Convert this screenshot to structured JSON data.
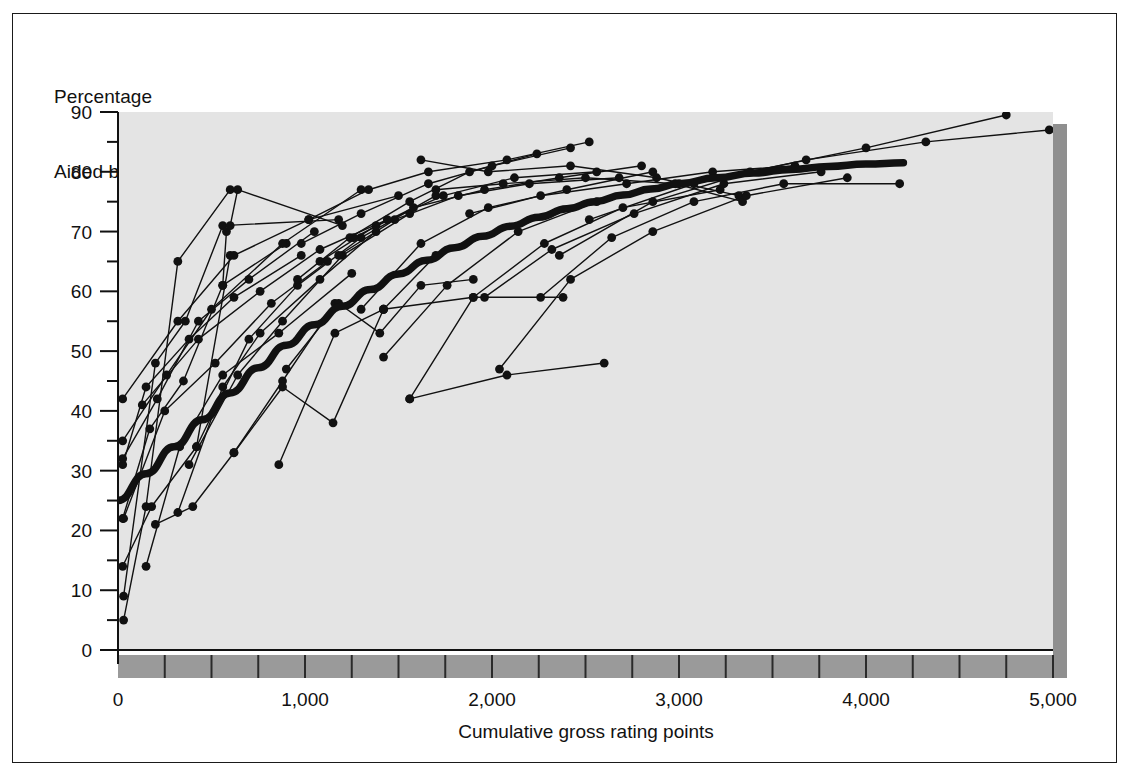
{
  "figure": {
    "title_lines": [
      "Percentage",
      "Aided brand awareness"
    ],
    "x_axis_title": "Cumulative gross rating points",
    "background": "#ffffff",
    "plot_fill": "#e4e4e4",
    "band_fill": "#9a9a9a",
    "shadow_fill": "#8f8f8f",
    "ink": "#111111"
  },
  "chart_data": {
    "type": "line",
    "title": "Aided brand awareness",
    "subtitle": "Percentage",
    "xlabel": "Cumulative gross rating points",
    "ylabel": "Percentage / Aided brand awareness",
    "xlim": [
      0,
      5000
    ],
    "ylim": [
      0,
      90
    ],
    "xticks": [
      0,
      1000,
      2000,
      3000,
      4000,
      5000
    ],
    "xticklabels": [
      "0",
      "1,000",
      "2,000",
      "3,000",
      "4,000",
      "5,000"
    ],
    "yticks": [
      0,
      10,
      20,
      30,
      40,
      50,
      60,
      70,
      80,
      90
    ],
    "yticklabels": [
      "0",
      "10",
      "20",
      "30",
      "40",
      "50",
      "60",
      "70",
      "80",
      "90"
    ],
    "y_minor_ticks": [
      5,
      15,
      25,
      35,
      45,
      55,
      65,
      75,
      85
    ],
    "x_minor_step": 250,
    "grid": false,
    "legend": null,
    "marker": "filled-circle",
    "trend": {
      "name": "Fitted response curve",
      "style": "thick-smooth-line",
      "points": [
        [
          0,
          25.0
        ],
        [
          150,
          29.5
        ],
        [
          300,
          34.0
        ],
        [
          450,
          38.5
        ],
        [
          600,
          43.0
        ],
        [
          750,
          47.2
        ],
        [
          900,
          51.0
        ],
        [
          1050,
          54.4
        ],
        [
          1200,
          57.5
        ],
        [
          1350,
          60.3
        ],
        [
          1500,
          62.9
        ],
        [
          1650,
          65.2
        ],
        [
          1800,
          67.3
        ],
        [
          1950,
          69.2
        ],
        [
          2100,
          70.9
        ],
        [
          2250,
          72.4
        ],
        [
          2400,
          73.8
        ],
        [
          2550,
          75.0
        ],
        [
          2700,
          76.1
        ],
        [
          2850,
          77.1
        ],
        [
          3000,
          78.0
        ],
        [
          3200,
          79.0
        ],
        [
          3400,
          79.8
        ],
        [
          3600,
          80.4
        ],
        [
          3800,
          80.9
        ],
        [
          4000,
          81.3
        ],
        [
          4200,
          81.5
        ]
      ]
    },
    "series": [
      {
        "name": "brand-01",
        "points": [
          [
            30,
            5
          ],
          [
            150,
            24
          ],
          [
            320,
            65
          ],
          [
            600,
            77
          ]
        ]
      },
      {
        "name": "brand-02",
        "points": [
          [
            30,
            9
          ],
          [
            200,
            48
          ],
          [
            360,
            55
          ],
          [
            560,
            71
          ],
          [
            1180,
            72
          ]
        ]
      },
      {
        "name": "brand-03",
        "points": [
          [
            25,
            14
          ],
          [
            180,
            24
          ],
          [
            420,
            34
          ],
          [
            600,
            66
          ]
        ]
      },
      {
        "name": "brand-04",
        "points": [
          [
            25,
            22
          ],
          [
            170,
            37
          ],
          [
            350,
            45
          ],
          [
            560,
            61
          ],
          [
            900,
            68
          ]
        ]
      },
      {
        "name": "brand-05",
        "points": [
          [
            25,
            31
          ],
          [
            150,
            44
          ],
          [
            380,
            52
          ],
          [
            620,
            59
          ],
          [
            980,
            66
          ]
        ]
      },
      {
        "name": "brand-06",
        "points": [
          [
            25,
            32
          ],
          [
            210,
            42
          ],
          [
            430,
            55
          ],
          [
            700,
            62
          ],
          [
            1050,
            70
          ]
        ]
      },
      {
        "name": "brand-07",
        "points": [
          [
            25,
            35
          ],
          [
            260,
            46
          ],
          [
            500,
            57
          ],
          [
            880,
            68
          ],
          [
            1300,
            77
          ]
        ]
      },
      {
        "name": "brand-08",
        "points": [
          [
            25,
            42
          ],
          [
            320,
            55
          ],
          [
            620,
            66
          ],
          [
            1020,
            72
          ],
          [
            1500,
            76
          ]
        ]
      },
      {
        "name": "brand-09",
        "points": [
          [
            150,
            14
          ],
          [
            330,
            34
          ],
          [
            560,
            46
          ],
          [
            860,
            53
          ],
          [
            1250,
            63
          ]
        ]
      },
      {
        "name": "brand-10",
        "points": [
          [
            200,
            21
          ],
          [
            400,
            24
          ],
          [
            620,
            33
          ],
          [
            880,
            45
          ],
          [
            1160,
            58
          ]
        ]
      },
      {
        "name": "brand-11",
        "points": [
          [
            320,
            23
          ],
          [
            560,
            44
          ],
          [
            760,
            53
          ],
          [
            1080,
            62
          ],
          [
            1380,
            70
          ]
        ]
      },
      {
        "name": "brand-12",
        "points": [
          [
            380,
            31
          ],
          [
            640,
            46
          ],
          [
            880,
            55
          ],
          [
            1200,
            66
          ],
          [
            1560,
            73
          ]
        ]
      },
      {
        "name": "brand-13",
        "points": [
          [
            420,
            34
          ],
          [
            700,
            52
          ],
          [
            960,
            61
          ],
          [
            1300,
            69
          ],
          [
            1700,
            76
          ]
        ]
      },
      {
        "name": "brand-14",
        "points": [
          [
            560,
            61
          ],
          [
            580,
            70
          ],
          [
            600,
            71
          ],
          [
            640,
            77
          ],
          [
            1200,
            71
          ]
        ]
      },
      {
        "name": "brand-15",
        "points": [
          [
            620,
            33
          ],
          [
            880,
            44
          ],
          [
            1150,
            38
          ],
          [
            1420,
            57
          ]
        ]
      },
      {
        "name": "brand-16",
        "points": [
          [
            860,
            31
          ],
          [
            1160,
            53
          ],
          [
            1420,
            57
          ],
          [
            1700,
            66
          ]
        ]
      },
      {
        "name": "brand-17",
        "points": [
          [
            900,
            47
          ],
          [
            1180,
            58
          ],
          [
            1400,
            53
          ],
          [
            1620,
            61
          ],
          [
            1900,
            62
          ]
        ]
      },
      {
        "name": "brand-18",
        "points": [
          [
            960,
            62
          ],
          [
            1240,
            69
          ],
          [
            1560,
            75
          ],
          [
            1880,
            80
          ],
          [
            2240,
            83
          ]
        ]
      },
      {
        "name": "brand-19",
        "points": [
          [
            980,
            68
          ],
          [
            1300,
            73
          ],
          [
            1660,
            78
          ],
          [
            2000,
            81
          ],
          [
            2420,
            84
          ]
        ]
      },
      {
        "name": "brand-20",
        "points": [
          [
            1020,
            72
          ],
          [
            1340,
            77
          ],
          [
            1660,
            80
          ],
          [
            2080,
            82
          ],
          [
            2520,
            85
          ]
        ]
      },
      {
        "name": "brand-21",
        "points": [
          [
            1080,
            65
          ],
          [
            1380,
            71
          ],
          [
            1740,
            76
          ],
          [
            2120,
            79
          ],
          [
            2560,
            80
          ]
        ]
      },
      {
        "name": "brand-22",
        "points": [
          [
            1180,
            66
          ],
          [
            1480,
            72
          ],
          [
            1820,
            76
          ],
          [
            2200,
            78
          ],
          [
            2680,
            79
          ]
        ]
      },
      {
        "name": "brand-23",
        "points": [
          [
            1260,
            69
          ],
          [
            1580,
            74
          ],
          [
            1960,
            77
          ],
          [
            2360,
            79
          ],
          [
            2800,
            81
          ]
        ]
      },
      {
        "name": "brand-24",
        "points": [
          [
            1300,
            57
          ],
          [
            1620,
            68
          ],
          [
            1980,
            74
          ],
          [
            2400,
            77
          ],
          [
            2860,
            80
          ]
        ]
      },
      {
        "name": "brand-25",
        "points": [
          [
            1420,
            49
          ],
          [
            1760,
            61
          ],
          [
            2140,
            70
          ],
          [
            2560,
            75
          ],
          [
            3000,
            78
          ]
        ]
      },
      {
        "name": "brand-26",
        "points": [
          [
            1560,
            42
          ],
          [
            1900,
            59
          ],
          [
            2280,
            68
          ],
          [
            2700,
            74
          ],
          [
            3220,
            77
          ]
        ]
      },
      {
        "name": "brand-27",
        "points": [
          [
            1620,
            82
          ],
          [
            1980,
            80
          ],
          [
            2420,
            81
          ],
          [
            2880,
            79
          ],
          [
            3320,
            76
          ]
        ]
      },
      {
        "name": "brand-28",
        "points": [
          [
            1700,
            77
          ],
          [
            2060,
            78
          ],
          [
            2500,
            79
          ],
          [
            2980,
            78
          ],
          [
            3340,
            75
          ]
        ]
      },
      {
        "name": "brand-29",
        "points": [
          [
            1880,
            73
          ],
          [
            2260,
            76
          ],
          [
            2720,
            78
          ],
          [
            3180,
            80
          ],
          [
            3620,
            81
          ]
        ]
      },
      {
        "name": "brand-30",
        "points": [
          [
            1960,
            59
          ],
          [
            2320,
            67
          ],
          [
            2760,
            73
          ],
          [
            3240,
            78
          ],
          [
            3760,
            80
          ]
        ]
      },
      {
        "name": "brand-31",
        "points": [
          [
            2040,
            47
          ],
          [
            2420,
            62
          ],
          [
            2860,
            70
          ],
          [
            3360,
            76
          ],
          [
            3900,
            79
          ]
        ]
      },
      {
        "name": "brand-32",
        "points": [
          [
            2260,
            59
          ],
          [
            2640,
            69
          ],
          [
            3080,
            75
          ],
          [
            3560,
            78
          ],
          [
            4180,
            78
          ]
        ]
      },
      {
        "name": "brand-33",
        "points": [
          [
            1560,
            42
          ],
          [
            2080,
            46
          ],
          [
            2600,
            48
          ]
        ]
      },
      {
        "name": "brand-34",
        "points": [
          [
            1420,
            57
          ],
          [
            1900,
            59
          ],
          [
            2380,
            59
          ]
        ]
      },
      {
        "name": "brand-35",
        "points": [
          [
            2360,
            66
          ],
          [
            2860,
            75
          ],
          [
            3380,
            80
          ],
          [
            4000,
            84
          ],
          [
            4750,
            89.5
          ]
        ]
      },
      {
        "name": "brand-36",
        "points": [
          [
            2520,
            72
          ],
          [
            3080,
            78
          ],
          [
            3680,
            82
          ],
          [
            4320,
            85
          ],
          [
            4980,
            87
          ]
        ]
      },
      {
        "name": "brand-37",
        "points": [
          [
            30,
            22
          ],
          [
            250,
            40
          ],
          [
            520,
            48
          ],
          [
            820,
            58
          ],
          [
            1120,
            65
          ]
        ]
      },
      {
        "name": "brand-38",
        "points": [
          [
            130,
            41
          ],
          [
            430,
            52
          ],
          [
            760,
            60
          ],
          [
            1080,
            67
          ],
          [
            1440,
            72
          ]
        ]
      }
    ]
  }
}
